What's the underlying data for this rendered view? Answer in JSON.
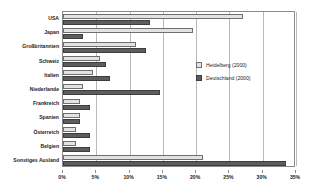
{
  "chart_data": {
    "type": "bar",
    "orientation": "horizontal",
    "title": "",
    "subtitle": "",
    "xlabel": "",
    "ylabel": "",
    "xlim": [
      0,
      35
    ],
    "xticks": [
      0,
      5,
      10,
      15,
      20,
      25,
      30,
      35
    ],
    "xtick_labels": [
      "0%",
      "5%",
      "10%",
      "15%",
      "20%",
      "25%",
      "30%",
      "35%"
    ],
    "grid": true,
    "legend_position": "inside-right",
    "categories": [
      "USA",
      "Japan",
      "Großbritannien",
      "Schweiz",
      "Italien",
      "Niederlande",
      "Frankreich",
      "Spanien",
      "Österreich",
      "Belgien",
      "Sonstiges Ausland"
    ],
    "series": [
      {
        "name": "Heidelberg (2000)",
        "color": "#e3e3e3",
        "values": [
          27.0,
          19.5,
          11.0,
          5.5,
          4.5,
          3.0,
          2.5,
          2.5,
          2.0,
          2.0,
          21.0
        ]
      },
      {
        "name": "Deutschland (2000)",
        "color": "#5d5d5d",
        "values": [
          13.0,
          3.0,
          12.5,
          6.5,
          7.0,
          14.5,
          4.0,
          2.5,
          4.0,
          4.0,
          33.5
        ]
      }
    ]
  },
  "legend": {
    "items": [
      {
        "label": "Heidelberg (2000)"
      },
      {
        "label": "Deutschland (2000)"
      }
    ]
  }
}
